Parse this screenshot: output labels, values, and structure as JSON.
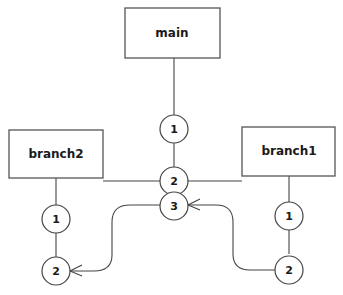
{
  "diagram": {
    "type": "git-branch-graph",
    "colors": {
      "stroke": "#444444",
      "fill": "#ffffff",
      "text": "#1a1a1a"
    },
    "branches": [
      {
        "id": "main",
        "label": "main"
      },
      {
        "id": "branch2",
        "label": "branch2"
      },
      {
        "id": "branch1",
        "label": "branch1"
      }
    ],
    "commits": {
      "main": [
        {
          "label": "1"
        },
        {
          "label": "2"
        },
        {
          "label": "3"
        }
      ],
      "branch2": [
        {
          "label": "1"
        },
        {
          "label": "2"
        }
      ],
      "branch1": [
        {
          "label": "1"
        },
        {
          "label": "2"
        }
      ]
    },
    "edges": [
      {
        "from": "main-box",
        "to": "main-1",
        "style": "line"
      },
      {
        "from": "main-1",
        "to": "main-2",
        "style": "line"
      },
      {
        "from": "main-2",
        "to": "main-3",
        "style": "line"
      },
      {
        "from": "main-2",
        "to": "branch2-box",
        "style": "line"
      },
      {
        "from": "main-2",
        "to": "branch1-box",
        "style": "line"
      },
      {
        "from": "branch2-box",
        "to": "branch2-1",
        "style": "line"
      },
      {
        "from": "branch2-1",
        "to": "branch2-2",
        "style": "line"
      },
      {
        "from": "branch1-box",
        "to": "branch1-1",
        "style": "line"
      },
      {
        "from": "branch1-1",
        "to": "branch1-2",
        "style": "line"
      },
      {
        "from": "main-3",
        "to": "branch2-2",
        "style": "curved-arrow"
      },
      {
        "from": "branch1-2",
        "to": "main-3",
        "style": "curved-arrow"
      }
    ]
  }
}
